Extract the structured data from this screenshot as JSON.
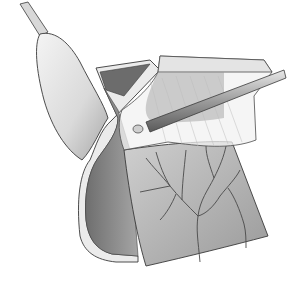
{
  "figure": {
    "colors": {
      "background": "#ffffff",
      "outline": "#3a3a3a",
      "light_tissue": "#e6e6e6",
      "mid_tissue": "#b5b5b5",
      "dark_tissue": "#7a7a7a",
      "vessel": "#4a4a4a",
      "translucent": "#f2f2f2"
    }
  }
}
